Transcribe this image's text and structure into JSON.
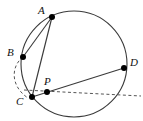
{
  "figure": {
    "canvas": {
      "width": 143,
      "height": 121
    },
    "stroke_color": "#3a3a3a",
    "dash_color": "#555555",
    "point_color": "#000000",
    "label_color": "#111111",
    "background": "#ffffff"
  },
  "circle": {
    "name": "main-circle",
    "cx": 74,
    "cy": 64,
    "r": 53,
    "stroke_width": 1.1
  },
  "points": [
    {
      "id": "A",
      "label": "A",
      "x": 52,
      "y": 17,
      "label_x": 38,
      "label_y": 5,
      "radius": 3.0
    },
    {
      "id": "B",
      "label": "B",
      "x": 23,
      "y": 57,
      "label_x": 7,
      "label_y": 47,
      "radius": 3.0
    },
    {
      "id": "C",
      "label": "C",
      "x": 32,
      "y": 97,
      "label_x": 16,
      "label_y": 96,
      "radius": 3.0
    },
    {
      "id": "P",
      "label": "P",
      "x": 47,
      "y": 92,
      "label_x": 44,
      "label_y": 76,
      "radius": 3.0
    },
    {
      "id": "D",
      "label": "D",
      "x": 124,
      "y": 68,
      "label_x": 130,
      "label_y": 57,
      "radius": 3.0
    }
  ],
  "segments": [
    {
      "id": "chord-AB",
      "from": "A",
      "to": "B",
      "x1": 52,
      "y1": 17,
      "x2": 23,
      "y2": 57,
      "style": "solid"
    },
    {
      "id": "segment-AC",
      "from": "A",
      "to": "C",
      "x1": 52,
      "y1": 17,
      "x2": 32,
      "y2": 97,
      "style": "solid"
    },
    {
      "id": "chord-CD",
      "from": "C",
      "to": "D",
      "x1": 32,
      "y1": 97,
      "x2": 124,
      "y2": 68,
      "style": "solid"
    }
  ],
  "dashed_line": {
    "id": "tangent-line-C",
    "x1": 24,
    "y1": 90,
    "x2": 141,
    "y2": 96,
    "dasharray": "3,2.5"
  },
  "dashed_arc": {
    "id": "arc-B-to-C",
    "path": "M 23 57 C 11 66, 10 86, 28 98",
    "dasharray": "3,2.5"
  }
}
